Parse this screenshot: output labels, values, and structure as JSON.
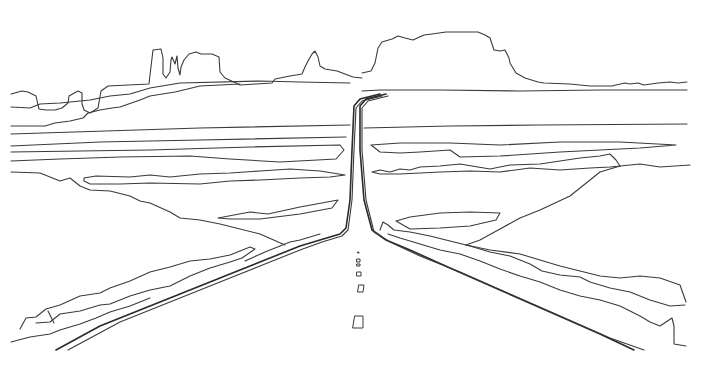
{
  "image": {
    "width": 727,
    "height": 374,
    "background": "#ffffff",
    "stroke": "#3a3a3a"
  },
  "scene": {
    "buttes": [
      {
        "name": "far-left-butte",
        "d": "M11 94 L22 91 L28 92 L36 96 L38 105 L39 109 L46 110 L55 110 L62 108 L68 103 L69 96 L78 91 L82 93 L82 104 L84 110 L90 113 L98 108 L101 91 L108 86 L149 84 L150 75 L153 50 L161 49 L163 58 L163 74 L166 78 L170 72 L171 60 L172 57 L175 64 L177 56 L178 68 L180 75 L181 67 L184 60 L189 54 L196 52 L201 54 L212 54 L219 57 L220 72 L225 78 L236 83 L240 85 L256 84 L272 83 L275 79 L290 76 L302 74 L305 67 L308 61 L312 54 L315 51 L318 57 L320 66 L325 69 L337 71 L345 74 L353 77 L362 78"
      },
      {
        "name": "right-mesa",
        "d": "M362 73 L371 71 L375 63 L378 48 L382 42 L392 39 L398 36 L405 38 L413 40 L424 35 L432 34 L446 32 L478 32 L485 35 L490 38 L493 47 L494 50 L500 51 L505 50 L508 56 L509 58 L510 63 L516 73 L525 78 L538 82 L544 83 L570 84 L590 86 L612 86 L616 85 L625 83 L630 84 L638 83 L644 85 L658 83 L670 82 L678 83 L687 82"
      }
    ],
    "horizon_lines": [
      {
        "name": "ridge-left-low",
        "d": "M11 107 L30 108 L40 104 L60 103 L90 100 L110 96 L130 94 L150 88 L180 83 L260 81 L300 82 L350 83"
      },
      {
        "name": "ridge-left-mid",
        "d": "M11 126 L45 126 L55 123 L70 121 L83 118 L88 113 L100 110 L112 108 L120 107 L140 100 L150 96 L175 92 L200 86 L240 84"
      },
      {
        "name": "horizon-main-left",
        "d": "M11 134 L200 128 L350 125"
      },
      {
        "name": "horizon-main-right",
        "d": "M362 91 L380 90 L440 90 L520 91 L600 90 L687 90"
      },
      {
        "name": "mid-band-left",
        "d": "M11 146 L100 142 L200 140 L346 137"
      },
      {
        "name": "mid-band-right",
        "d": "M364 128 L450 126 L540 125 L687 124"
      }
    ],
    "terrain_left": [
      {
        "name": "left-shelf-1",
        "d": "M11 152 L80 151 L150 150 L250 147 L340 145 L344 150 L336 159 L280 162 L230 159 L190 156 L120 157 L60 159 L11 161"
      },
      {
        "name": "left-shelf-2",
        "d": "M84 178 L96 176 L130 177 L150 175 L170 177 L200 174 L230 173 L260 171 L290 169 L320 171 L345 175 L330 177 L300 178 L260 180 L230 181 L200 184 L150 183 L120 184 L90 184 L84 181 Z"
      },
      {
        "name": "left-slope",
        "d": "M11 172 L40 173 L60 181 L70 178 L80 186 L90 190 L110 191 L130 196 L140 201 L150 203 L170 212 L180 218 L200 220 L220 224 L260 234 L285 245"
      },
      {
        "name": "left-lens",
        "d": "M218 218 L250 212 L268 214 L300 207 L338 200 L332 208 L300 214 L260 219 L230 219 Z"
      }
    ],
    "terrain_right": [
      {
        "name": "right-shelf-1",
        "d": "M371 145 L400 143 L450 143 L500 145 L560 142 L620 142 L676 145 L640 148 L560 152 L500 156 L460 157 L450 150 L420 152 L400 153 L380 152 L371 145"
      },
      {
        "name": "right-shelf-2",
        "d": "M372 172 L380 170 L390 172 L400 169 L410 170 L420 167 L440 166 L460 164 L490 169 L510 165 L540 164 L560 161 L580 158 L600 156 L610 154 L616 160 L620 166 L610 167 L590 168 L560 170 L530 168 L500 172 L470 171 L440 172 L420 173 L400 174 L380 174 L372 172"
      },
      {
        "name": "right-tail",
        "d": "M620 166 L640 164 L660 167 L690 165"
      },
      {
        "name": "right-diagonal",
        "d": "M620 166 L600 172 L570 196 L540 210 L520 218 L500 229 L480 240 L466 245"
      },
      {
        "name": "right-lens",
        "d": "M396 221 L410 217 L440 213 L470 212 L500 213 L496 220 L470 226 L440 228 L410 229 L396 221 Z"
      }
    ],
    "road": [
      {
        "name": "road-left-edge-far",
        "cls": "thick",
        "d": "M380 94 L360 99 L354 106 L352 150 L350 200 L346 228 L340 234 L320 240 L300 246 L280 254 L240 270 L200 286 L150 306 L100 326 L56 350"
      },
      {
        "name": "road-left-edge-inner",
        "d": "M382 96 L362 101 L356 108 L354 150 L352 200 L348 230 L342 236 L322 242 L300 250 L260 266 L220 282 L170 302 L120 322 L68 350"
      },
      {
        "name": "road-right-edge",
        "cls": "thick",
        "d": "M386 94 L366 99 L360 106 L360 150 L364 200 L372 230 L386 240 L410 250 L450 268 L500 290 L550 312 L600 334 L634 350"
      },
      {
        "name": "road-right-edge-inner",
        "d": "M388 96 L368 101 L362 108 L362 150 L366 200 L374 232 L390 242 L420 256 L460 272 L510 294 L560 316 L610 338 L644 350"
      }
    ],
    "roadside_left": [
      {
        "name": "left-verge-1",
        "d": "M20 329 L26 318 L36 317 L46 309 L60 305 L80 296 L100 293 L110 288 L130 281 L150 272 L170 267 L190 261 L210 259 L230 255 L240 251 L250 247 L255 249 L242 258 L230 262 L210 268 L190 276 L170 286 L160 288 L150 290 L130 296 L110 304 L100 305 L80 311 L60 314 L50 322 L36 323"
      },
      {
        "name": "left-verge-2",
        "d": "M11 342 L30 337 L50 334 L60 330 L80 324 L96 318 L110 312 L130 306 L150 298"
      },
      {
        "name": "left-verge-3",
        "d": "M245 261 L265 252 L280 246 L290 242 L300 240 L320 234"
      },
      {
        "name": "left-verge-notch",
        "d": "M48 311 L54 323"
      }
    ],
    "roadside_right": [
      {
        "name": "right-verge-1",
        "d": "M380 230 L383 222 L388 225 L394 230 L410 232 L430 236 L450 241 L470 246 L490 252 L510 256 L530 264 L542 271 L560 275 L580 277 L590 282 L610 288 L630 292 L650 300 L670 306 L685 305"
      },
      {
        "name": "right-verge-2",
        "d": "M388 234 L400 238 L420 244 L440 250 L460 254 L480 261 L500 269 L520 276 L540 282 L560 290 L580 296 L600 300 L620 306 L640 316 L650 322 L660 326 L672 318 L674 326 L674 344 L686 346"
      },
      {
        "name": "right-verge-3",
        "d": "M466 245 L490 250 L520 254 L540 260 L560 266 L580 271 L600 276 L620 278 L640 276 L660 278 L680 285 L686 302"
      }
    ],
    "lane_markings": [
      {
        "name": "dash-1",
        "d": "M358 252 L359 252 L359 253 L358 253 Z"
      },
      {
        "name": "dash-2",
        "d": "M357 259 L360 259 L360 262 L357 262 Z"
      },
      {
        "name": "dash-3",
        "d": "M357 264 L360 264 L360 266 L357 266 Z"
      },
      {
        "name": "dash-4",
        "d": "M357 272 L361 272 L361 276 L357 276 Z"
      },
      {
        "name": "dash-5",
        "d": "M359 285 L364 285 L363 292 L358 292 Z"
      },
      {
        "name": "dash-6",
        "d": "M355 316 L363 316 L363 328 L353 328 Z"
      }
    ]
  }
}
